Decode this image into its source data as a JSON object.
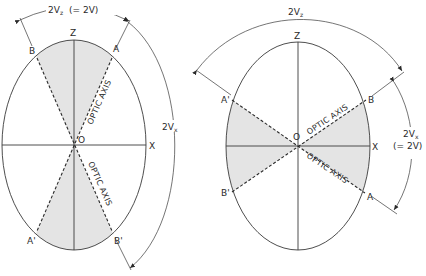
{
  "figure": {
    "colors": {
      "shade": "#e4e4e4",
      "line": "#3a3a3a"
    },
    "left_diagram": {
      "axis_labels": {
        "z": "Z",
        "x": "X",
        "origin": "O"
      },
      "point_labels": {
        "a": "A",
        "b": "B",
        "a_prime": "A'",
        "b_prime": "B'"
      },
      "optic_axis_upper": "OPTIC AXIS",
      "optic_axis_lower": "OPTIC AXIS",
      "top_angle_label": "2Vz",
      "top_angle_label_main": "2V",
      "top_angle_label_sub": "z",
      "top_angle_equiv": "(= 2V)",
      "side_angle_label_main": "2V",
      "side_angle_label_sub": "x"
    },
    "right_diagram": {
      "axis_labels": {
        "z": "Z",
        "x": "X",
        "origin": "O"
      },
      "point_labels": {
        "a": "A",
        "b": "B",
        "a_prime": "A'",
        "b_prime": "B'"
      },
      "optic_axis_upper": "OPTIC AXIS",
      "optic_axis_lower": "OPTIC AXIS",
      "top_angle_label_main": "2V",
      "top_angle_label_sub": "z",
      "side_angle_label_main": "2V",
      "side_angle_label_sub": "x",
      "side_angle_equiv": "(= 2V)"
    }
  }
}
